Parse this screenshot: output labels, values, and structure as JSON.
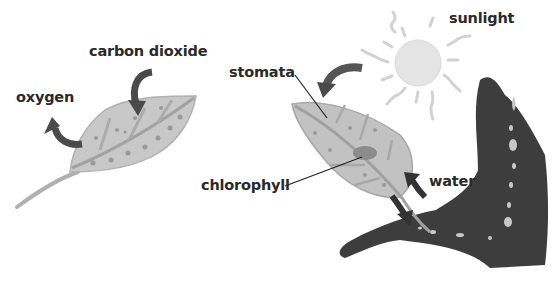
{
  "diagram": {
    "type": "photosynthesis-illustration",
    "style": "watercolor-grayscale",
    "left_panel": {
      "labels": {
        "carbon_dioxide": "carbon dioxide",
        "oxygen": "oxygen"
      },
      "arrows": [
        {
          "name": "carbon-dioxide-in",
          "direction": "into leaf"
        },
        {
          "name": "oxygen-out",
          "direction": "out of leaf"
        }
      ]
    },
    "right_panel": {
      "labels": {
        "sunlight": "sunlight",
        "stomata": "stomata",
        "chlorophyll": "chlorophyll",
        "water": "water"
      },
      "arrows": [
        {
          "name": "sunlight-to-leaf",
          "direction": "sun toward leaf"
        },
        {
          "name": "water-in",
          "direction": "into leaf from stem"
        },
        {
          "name": "sugar-out",
          "direction": "from leaf toward branch"
        }
      ]
    },
    "colors": {
      "leaf_fill": "#c4c4c4",
      "leaf_edge": "#a9a9a9",
      "vein": "#9a9a9a",
      "arrow": "#4a4a4a",
      "tree": "#3d3d3d",
      "sun": "#e6e6e6",
      "text": "#2a2a2a"
    }
  }
}
